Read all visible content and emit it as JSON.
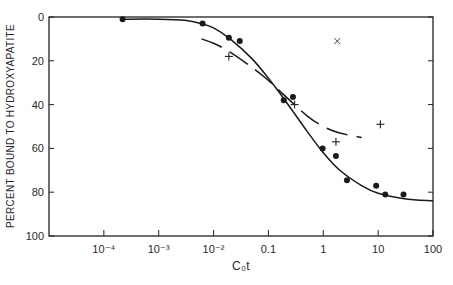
{
  "chart_data": {
    "type": "scatter",
    "title": "",
    "xlabel": "C₀t",
    "ylabel": "PERCENT BOUND TO HYDROXYAPATITE",
    "xscale": "log",
    "xlim": [
      1e-05,
      100
    ],
    "ylim": [
      0,
      100
    ],
    "y_inverted": true,
    "grid": false,
    "x_ticks": [
      {
        "value": 0.0001,
        "label": "10⁻⁴"
      },
      {
        "value": 0.001,
        "label": "10⁻³"
      },
      {
        "value": 0.01,
        "label": "10⁻²"
      },
      {
        "value": 0.1,
        "label": "0.1"
      },
      {
        "value": 1,
        "label": "1"
      },
      {
        "value": 10,
        "label": "10"
      },
      {
        "value": 100,
        "label": "100"
      }
    ],
    "y_ticks": [
      {
        "value": 0,
        "label": "0"
      },
      {
        "value": 20,
        "label": "20"
      },
      {
        "value": 40,
        "label": "40"
      },
      {
        "value": 60,
        "label": "60"
      },
      {
        "value": 80,
        "label": "80"
      },
      {
        "value": 100,
        "label": "100"
      }
    ],
    "series": [
      {
        "name": "filled circles",
        "marker": "dot",
        "x": [
          0.00022,
          0.0063,
          0.019,
          0.03,
          0.19,
          0.28,
          0.97,
          1.7,
          2.7,
          9.2,
          13.5,
          29
        ],
        "y": [
          1,
          3,
          9.5,
          11,
          38,
          36.5,
          60,
          63.5,
          74.5,
          77,
          81,
          81
        ]
      },
      {
        "name": "crosses",
        "marker": "plus",
        "x": [
          0.019,
          0.3,
          1.7,
          11
        ],
        "y": [
          18,
          40,
          57,
          49
        ]
      },
      {
        "name": "x mark",
        "marker": "x",
        "x": [
          1.8
        ],
        "y": [
          11
        ]
      },
      {
        "name": "solid fit curve",
        "style": "solid",
        "x": [
          0.00022,
          0.001,
          0.003,
          0.006,
          0.01,
          0.02,
          0.05,
          0.1,
          0.2,
          0.5,
          1,
          2,
          5,
          10,
          30,
          100
        ],
        "y": [
          1,
          1,
          1.5,
          3,
          5,
          10,
          19,
          28,
          38,
          52,
          62,
          70,
          77,
          80.5,
          83,
          84
        ]
      },
      {
        "name": "dashed fit curve",
        "style": "dashed",
        "x": [
          0.006,
          0.01,
          0.02,
          0.05,
          0.1,
          0.2,
          0.5,
          1,
          2,
          5
        ],
        "y": [
          10,
          12,
          16,
          23,
          29,
          36,
          45,
          50,
          53,
          55
        ]
      }
    ]
  }
}
